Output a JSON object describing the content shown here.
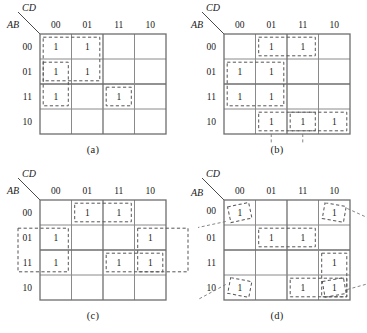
{
  "figure": {
    "type": "karnaugh-map-set",
    "column_variable_label": "CD",
    "row_variable_label": "AB",
    "column_headers": [
      "00",
      "01",
      "11",
      "10"
    ],
    "row_headers": [
      "00",
      "01",
      "11",
      "10"
    ],
    "cell_value": "1"
  },
  "maps": [
    {
      "id": "a",
      "caption": "(a)",
      "ones": [
        {
          "row": "00",
          "col": "00"
        },
        {
          "row": "00",
          "col": "01"
        },
        {
          "row": "01",
          "col": "00"
        },
        {
          "row": "01",
          "col": "01"
        },
        {
          "row": "11",
          "col": "00"
        },
        {
          "row": "11",
          "col": "11"
        }
      ],
      "groups": [
        {
          "name": "block-rows-00-01-cols-00-01",
          "row_start": 0,
          "row_end": 1,
          "col_start": 0,
          "col_end": 1,
          "size": 4
        },
        {
          "name": "column-00-rows-01-11",
          "row_start": 1,
          "row_end": 2,
          "col_start": 0,
          "col_end": 0,
          "size": 2
        },
        {
          "name": "single-row-11-col-11",
          "row_start": 2,
          "row_end": 2,
          "col_start": 2,
          "col_end": 2,
          "size": 1
        }
      ]
    },
    {
      "id": "b",
      "caption": "(b)",
      "ones": [
        {
          "row": "00",
          "col": "01"
        },
        {
          "row": "00",
          "col": "11"
        },
        {
          "row": "01",
          "col": "00"
        },
        {
          "row": "01",
          "col": "01"
        },
        {
          "row": "11",
          "col": "00"
        },
        {
          "row": "11",
          "col": "01"
        },
        {
          "row": "10",
          "col": "01"
        },
        {
          "row": "10",
          "col": "11"
        },
        {
          "row": "10",
          "col": "10"
        }
      ],
      "groups": [
        {
          "name": "pair-row-00-cols-01-11",
          "row_start": 0,
          "row_end": 0,
          "col_start": 1,
          "col_end": 2,
          "size": 2
        },
        {
          "name": "block-rows-01-11-cols-00-01",
          "row_start": 1,
          "row_end": 2,
          "col_start": 0,
          "col_end": 1,
          "size": 4
        },
        {
          "name": "row-10-cols-01-11",
          "row_start": 3,
          "row_end": 3,
          "col_start": 1,
          "col_end": 2,
          "size": 2
        },
        {
          "name": "row-10-cols-11-10",
          "row_start": 3,
          "row_end": 3,
          "col_start": 2,
          "col_end": 3,
          "size": 2
        }
      ]
    },
    {
      "id": "c",
      "caption": "(c)",
      "ones": [
        {
          "row": "00",
          "col": "01"
        },
        {
          "row": "00",
          "col": "11"
        },
        {
          "row": "01",
          "col": "00"
        },
        {
          "row": "01",
          "col": "10"
        },
        {
          "row": "11",
          "col": "00"
        },
        {
          "row": "11",
          "col": "11"
        },
        {
          "row": "11",
          "col": "10"
        }
      ],
      "groups": [
        {
          "name": "pair-row-00-cols-01-11",
          "row_start": 0,
          "row_end": 0,
          "col_start": 1,
          "col_end": 2,
          "size": 2
        },
        {
          "name": "wrap-column-00-rows-01-11",
          "row_start": 1,
          "row_end": 2,
          "col_start": 0,
          "col_end": 0,
          "size": 2,
          "wrap": "left"
        },
        {
          "name": "wrap-column-10-rows-01-11",
          "row_start": 1,
          "row_end": 2,
          "col_start": 3,
          "col_end": 3,
          "size": 2,
          "wrap": "right"
        },
        {
          "name": "pair-row-11-cols-11-10",
          "row_start": 2,
          "row_end": 2,
          "col_start": 2,
          "col_end": 3,
          "size": 2
        }
      ]
    },
    {
      "id": "d",
      "caption": "(d)",
      "ones": [
        {
          "row": "00",
          "col": "00"
        },
        {
          "row": "00",
          "col": "10"
        },
        {
          "row": "01",
          "col": "01"
        },
        {
          "row": "01",
          "col": "11"
        },
        {
          "row": "11",
          "col": "10"
        },
        {
          "row": "10",
          "col": "00"
        },
        {
          "row": "10",
          "col": "11"
        },
        {
          "row": "10",
          "col": "10"
        }
      ],
      "groups": [
        {
          "name": "corner-group-four-corners",
          "cells": [
            [
              0,
              0
            ],
            [
              0,
              3
            ],
            [
              3,
              0
            ],
            [
              3,
              3
            ]
          ],
          "size": 4,
          "style": "tilted-corners"
        },
        {
          "name": "pair-row-01-cols-01-11",
          "row_start": 1,
          "row_end": 1,
          "col_start": 1,
          "col_end": 2,
          "size": 2
        },
        {
          "name": "column-10-rows-11-10",
          "row_start": 2,
          "row_end": 3,
          "col_start": 3,
          "col_end": 3,
          "size": 2
        },
        {
          "name": "pair-row-10-cols-11-10",
          "row_start": 3,
          "row_end": 3,
          "col_start": 2,
          "col_end": 3,
          "size": 2
        }
      ]
    }
  ],
  "colors": {
    "background": "#ffffff",
    "grid": "#8a8a8a",
    "border": "#6e6e6e",
    "group_dash": "#555555",
    "text": "#1a1a1a"
  }
}
